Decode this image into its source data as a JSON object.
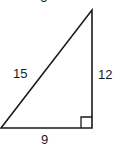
{
  "diagram": {
    "type": "right-triangle",
    "top_label_partial": "6",
    "sides": {
      "hypotenuse": "15",
      "vertical_leg": "12",
      "horizontal_leg": "9"
    },
    "right_angle_marker": true,
    "colors": {
      "stroke": "#1a1a1a",
      "background": "#ffffff"
    }
  }
}
